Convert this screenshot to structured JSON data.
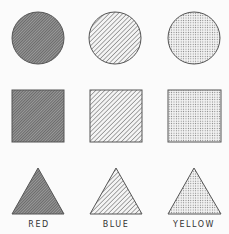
{
  "columns": [
    {
      "label": "RED",
      "pattern": "dense-hatch",
      "center_x": 38
    },
    {
      "label": "BLUE",
      "pattern": "diagonal-lines",
      "center_x": 115
    },
    {
      "label": "YELLOW",
      "pattern": "dots",
      "center_x": 194
    }
  ],
  "rows": [
    "circle",
    "square",
    "triangle"
  ],
  "colors": {
    "stroke": "#555555",
    "background": "#fbfbfb"
  }
}
